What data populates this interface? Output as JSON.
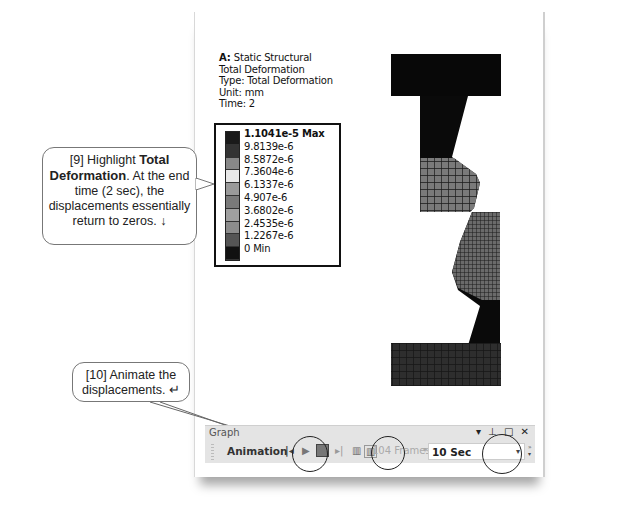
{
  "result_info": {
    "system": "A: Static Structural",
    "title": "Total Deformation",
    "type": "Type: Total Deformation",
    "unit": "Unit: mm",
    "time": "Time: 2"
  },
  "legend": {
    "labels": [
      "1.1041e-5 Max",
      "9.8139e-6",
      "8.5872e-6",
      "7.3604e-6",
      "6.1337e-6",
      "4.907e-6",
      "3.6802e-6",
      "2.4535e-6",
      "1.2267e-6",
      "0 Min"
    ],
    "colors": [
      "#1a1a1a",
      "#333333",
      "#888888",
      "#e8e8e8",
      "#9a9a9a",
      "#7a7a7a",
      "#a0a0a0",
      "#8c8c8c",
      "#555555",
      "#111111"
    ]
  },
  "callouts": {
    "step9": {
      "prefix": "[9] Highlight ",
      "bold": "Total Deformation",
      "suffix": ". At the end time (2 sec), the displacements essentially return to zeros. ↓"
    },
    "step10": {
      "text": "[10] Animate the displacements. ↵"
    }
  },
  "graph_panel": {
    "title": "Graph",
    "window_controls": "▾ ⊥ □ ✕",
    "toolbar": {
      "label": "Animation",
      "frames": "104 Frames",
      "duration": "10 Sec"
    }
  }
}
